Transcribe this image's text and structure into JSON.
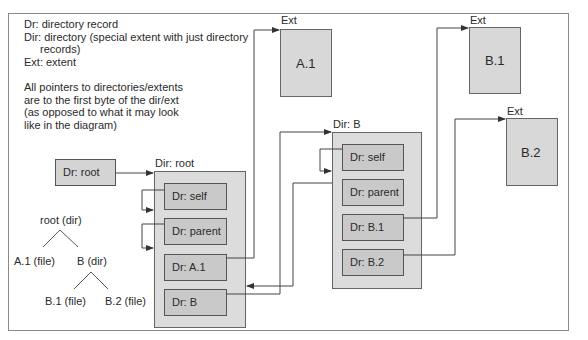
{
  "legend": {
    "lines": [
      "Dr: directory record",
      "Dir: directory (special extent with just directory",
      "records)",
      "Ext: extent"
    ],
    "note_lines": [
      "All pointers to directories/extents",
      "are to the first byte of the dir/ext",
      "(as opposed to what it may look",
      "like in the diagram)"
    ]
  },
  "tree": {
    "root": "root (dir)",
    "a1": "A.1 (file)",
    "b": "B (dir)",
    "b1": "B.1 (file)",
    "b2": "B.2 (file)"
  },
  "dr_root": {
    "label": "Dr: root"
  },
  "dir_root": {
    "title": "Dir: root",
    "records": [
      "Dr: self",
      "Dr: parent",
      "Dr: A.1",
      "Dr: B"
    ]
  },
  "dir_b": {
    "title": "Dir: B",
    "records": [
      "Dr: self",
      "Dr: parent",
      "Dr: B.1",
      "Dr: B.2"
    ]
  },
  "extents": {
    "a1": {
      "title": "Ext",
      "label": "A.1"
    },
    "b1": {
      "title": "Ext",
      "label": "B.1"
    },
    "b2": {
      "title": "Ext",
      "label": "B.2"
    }
  },
  "colors": {
    "outer_box": "#d9d9d9",
    "inner_box": "#c8c8c8",
    "stroke": "#555555",
    "line": "#444444"
  }
}
